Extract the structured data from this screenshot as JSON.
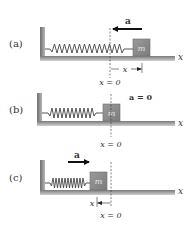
{
  "colors": {
    "wall": "#8a8a8a",
    "floor": "#9a9a9a",
    "block": "#8c8c8c",
    "block_edge": "#6b6b6b",
    "spring": "#444444",
    "arrow": "#111111",
    "text": "#333333"
  },
  "panels": [
    {
      "label": "(a)",
      "accel_label": "a",
      "accel_direction": "left",
      "mass_label": "m",
      "axis_label": "x",
      "origin_label": "x = 0",
      "displacement_label": "x",
      "state": "spring stretched"
    },
    {
      "label": "(b)",
      "accel_label": "a = 0",
      "mass_label": "m",
      "axis_label": "x",
      "origin_label": "x = 0",
      "state": "equilibrium"
    },
    {
      "label": "(c)",
      "accel_label": "a",
      "accel_direction": "right",
      "mass_label": "m",
      "axis_label": "x",
      "origin_label": "x = 0",
      "displacement_label": "x",
      "state": "spring compressed"
    }
  ]
}
